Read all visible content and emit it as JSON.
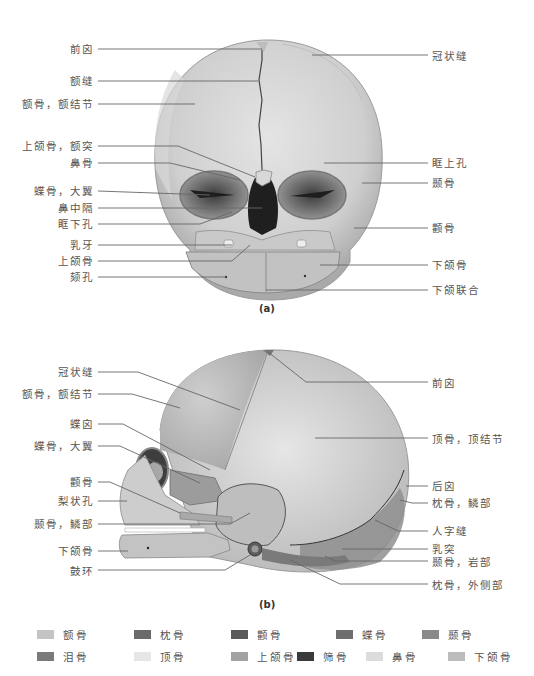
{
  "figure_a": {
    "caption": "(a)",
    "labels_left": [
      {
        "text": "前囟",
        "y": 48
      },
      {
        "text": "额缝",
        "y": 80
      },
      {
        "text": "额骨，额结节",
        "y": 103
      },
      {
        "text": "上颌骨，额突",
        "y": 145
      },
      {
        "text": "鼻骨",
        "y": 162
      },
      {
        "text": "蝶骨，大翼",
        "y": 190
      },
      {
        "text": "鼻中隔",
        "y": 207
      },
      {
        "text": "眶下孔",
        "y": 223
      },
      {
        "text": "乳牙",
        "y": 244
      },
      {
        "text": "上颌骨",
        "y": 260
      },
      {
        "text": "颏孔",
        "y": 276
      }
    ],
    "labels_right": [
      {
        "text": "冠状缝",
        "y": 56
      },
      {
        "text": "眶上孔",
        "y": 162
      },
      {
        "text": "颞骨",
        "y": 182
      },
      {
        "text": "颧骨",
        "y": 227
      },
      {
        "text": "下颌骨",
        "y": 264
      },
      {
        "text": "下颌联合",
        "y": 289
      }
    ]
  },
  "figure_b": {
    "caption": "(b)",
    "labels_left": [
      {
        "text": "冠状缝",
        "y": 371
      },
      {
        "text": "额骨，额结节",
        "y": 393
      },
      {
        "text": "蝶囟",
        "y": 423
      },
      {
        "text": "蝶骨，大翼",
        "y": 445
      },
      {
        "text": "颧骨",
        "y": 481
      },
      {
        "text": "梨状孔",
        "y": 500
      },
      {
        "text": "颞骨，鳞部",
        "y": 523
      },
      {
        "text": "下颌骨",
        "y": 550
      },
      {
        "text": "鼓环",
        "y": 570
      }
    ],
    "labels_right": [
      {
        "text": "前囟",
        "y": 382
      },
      {
        "text": "顶骨，顶结节",
        "y": 438
      },
      {
        "text": "后囟",
        "y": 485
      },
      {
        "text": "枕骨，鳞部",
        "y": 502
      },
      {
        "text": "人字缝",
        "y": 530
      },
      {
        "text": "乳突",
        "y": 548
      },
      {
        "text": "颞骨，岩部",
        "y": 561
      },
      {
        "text": "枕骨，外侧部",
        "y": 584
      }
    ]
  },
  "legend": {
    "items": [
      {
        "label": "额骨",
        "color": "#c4c4c4"
      },
      {
        "label": "枕骨",
        "color": "#6a6a6a"
      },
      {
        "label": "颧骨",
        "color": "#5a5a5a"
      },
      {
        "label": "蝶骨",
        "color": "#6e6e6e"
      },
      {
        "label": "颞骨",
        "color": "#8a8a8a"
      },
      {
        "label": "泪骨",
        "color": "#7a7a7a"
      },
      {
        "label": "顶骨",
        "color": "#e6e6e6"
      },
      {
        "label": "上颌骨",
        "color": "#a2a2a2"
      },
      {
        "label": "筛骨",
        "color": "#3a3a3a"
      },
      {
        "label": "鼻骨",
        "color": "#dcdcdc"
      },
      {
        "label": "下颌骨",
        "color": "#bcbcbc"
      }
    ]
  }
}
